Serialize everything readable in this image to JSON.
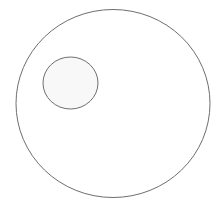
{
  "diagram": {
    "background": "#ffffff",
    "shapes": [
      {
        "id": "outer-circle",
        "cx": 113,
        "cy": 103.5,
        "rx": 97,
        "ry": 94,
        "fill": "#ffffff",
        "stroke": "#6e6e6e"
      },
      {
        "id": "inner-circle",
        "cx": 70.5,
        "cy": 83,
        "rx": 27.5,
        "ry": 26,
        "fill": "#f8f8f8",
        "stroke": "#6e6e6e"
      }
    ]
  }
}
